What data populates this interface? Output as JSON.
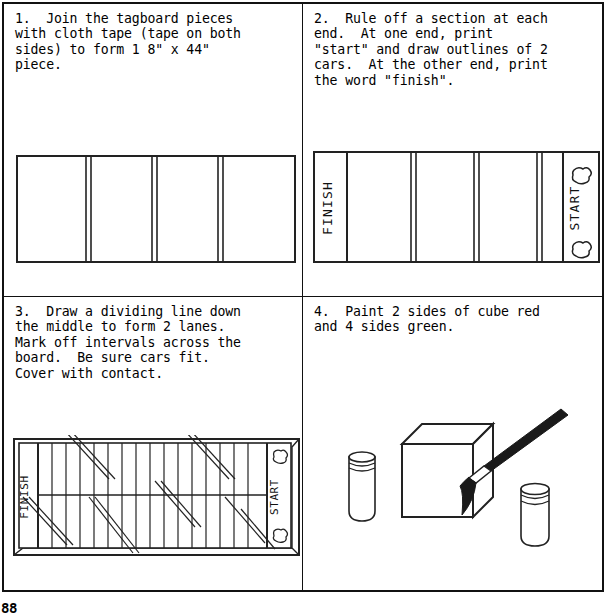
{
  "document": {
    "page_number": "88",
    "panels": [
      {
        "id": "panel-1",
        "number": "1.",
        "text": "1.  Join the tagboard pieces\nwith cloth tape (tape on both\nsides) to form 1 8\" x 44\"\npiece.",
        "figure": {
          "name": "tagboard-strip-diagram",
          "segments": 4,
          "labels": []
        }
      },
      {
        "id": "panel-2",
        "number": "2.",
        "text": "2.  Rule off a section at each\nend.  At one end, print\n\"start\" and draw outlines of 2\ncars.  At the other end, print\nthe word \"finish\".",
        "figure": {
          "name": "board-start-finish-diagram",
          "segments": 4,
          "labels": [
            "FINISH",
            "START"
          ],
          "car_outlines": 2
        }
      },
      {
        "id": "panel-3",
        "number": "3.",
        "text": "3.  Draw a dividing line down\nthe middle to form 2 lanes.\nMark off intervals across the\nboard.  Be sure cars fit.\nCover with contact.",
        "figure": {
          "name": "board-lanes-intervals-diagram",
          "lanes": 2,
          "intervals": 16,
          "labels": [
            "FINISH",
            "START"
          ],
          "car_outlines": 2
        }
      },
      {
        "id": "panel-4",
        "number": "4.",
        "text": "4.  Paint 2 sides of cube red\nand 4 sides green.",
        "figure": {
          "name": "cube-painting-diagram",
          "items": [
            "paint-jar",
            "cube",
            "paintbrush",
            "paint-jar"
          ]
        }
      }
    ]
  },
  "colors": {
    "ink": "#111111",
    "paper": "#ffffff",
    "brush_dark": "#1a1a1a"
  }
}
